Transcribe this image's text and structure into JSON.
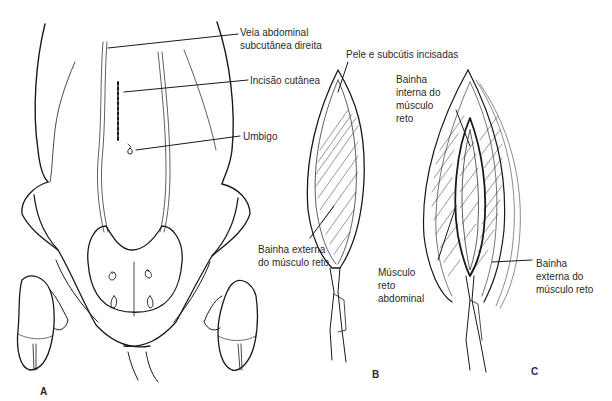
{
  "figure": {
    "panels": [
      {
        "id": "A",
        "label": "A",
        "description": "Ventral view of bovine abdomen with incision site",
        "annotations": [
          {
            "text": "Veia abdominal\nsubcutânea direita"
          },
          {
            "text": "Incisão cutânea"
          },
          {
            "text": "Umbigo"
          }
        ]
      },
      {
        "id": "B",
        "label": "B",
        "annotations": [
          {
            "text": "Pele e subcútis incisadas"
          },
          {
            "text": "Bainha externa\ndo músculo reto"
          }
        ]
      },
      {
        "id": "C",
        "label": "C",
        "annotations": [
          {
            "text": "Bainha\ninterna do\nmúsculo\nreto"
          },
          {
            "text": "Músculo\nreto\nabdominal"
          },
          {
            "text": "Bainha\nexterna do\nmúsculo reto"
          }
        ]
      }
    ]
  },
  "colors": {
    "line": "#1a1a1a",
    "text": "#2a2a2a",
    "background": "#ffffff"
  }
}
